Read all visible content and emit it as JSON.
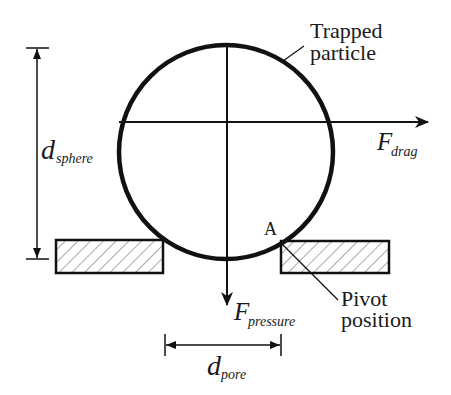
{
  "diagram": {
    "labels": {
      "trapped_line1": "Trapped",
      "trapped_line2": "particle",
      "f_drag_main": "F",
      "f_drag_sub": "drag",
      "f_pressure_main": "F",
      "f_pressure_sub": "pressure",
      "d_sphere_main": "d",
      "d_sphere_sub": "sphere",
      "d_pore_main": "d",
      "d_pore_sub": "pore",
      "point_a": "A",
      "pivot_line1": "Pivot",
      "pivot_line2": "position"
    },
    "colors": {
      "stroke": "#111111",
      "hatch": "#555555",
      "background": "#ffffff"
    }
  }
}
